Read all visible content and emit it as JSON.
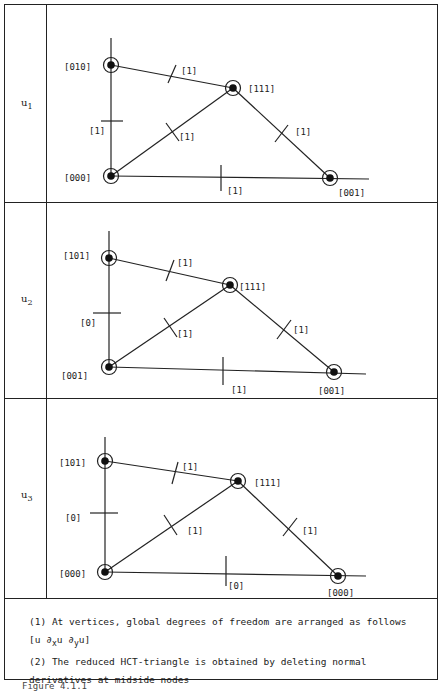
{
  "rows": [
    {
      "label": "u",
      "label_sub": "1",
      "vertices": {
        "top_left": "[010]",
        "apex": "[111]",
        "origin": "[000]",
        "bottom_right": "[001]"
      },
      "midsides": {
        "top": "[1]",
        "left": "[1]",
        "diagonal": "[1]",
        "right": "[1]",
        "bottom": "[1]"
      }
    },
    {
      "label": "u",
      "label_sub": "2",
      "vertices": {
        "top_left": "[101]",
        "apex": "[111]",
        "origin": "[001]",
        "bottom_right": "[001]"
      },
      "midsides": {
        "top": "[1]",
        "left": "[0]",
        "diagonal": "[1]",
        "right": "[1]",
        "bottom": "[1]"
      }
    },
    {
      "label": "u",
      "label_sub": "3",
      "vertices": {
        "top_left": "[101]",
        "apex": "[111]",
        "origin": "[000]",
        "bottom_right": "[000]"
      },
      "midsides": {
        "top": "[1]",
        "left": "[0]",
        "diagonal": "[1]",
        "right": "[1]",
        "bottom": "[0]"
      }
    }
  ],
  "notes": {
    "note1": "(1) At vertices, global degrees of freedom are arranged as follows",
    "note1_formula_prefix": "[u ∂",
    "note1_formula_x": "x",
    "note1_formula_mid": "u ∂",
    "note1_formula_y": "y",
    "note1_formula_suffix": "u]",
    "note2_line1": "(2) The reduced HCT-triangle is obtained by deleting normal",
    "note2_line2": "derivatives at midside nodes"
  },
  "footer": "Figure 4.1.1"
}
